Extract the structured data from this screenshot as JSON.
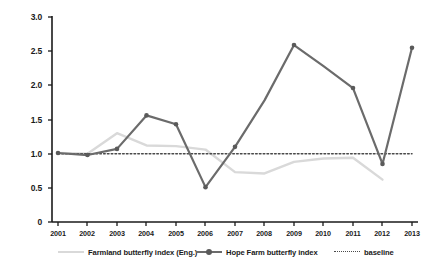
{
  "chart_data": {
    "type": "line",
    "title": "",
    "xlabel": "",
    "ylabel": "",
    "categories": [
      "2001",
      "2002",
      "2003",
      "2004",
      "2005",
      "2006",
      "2007",
      "2008",
      "2009",
      "2010",
      "2011",
      "2012",
      "2013"
    ],
    "x": [
      2001,
      2002,
      2003,
      2004,
      2005,
      2006,
      2007,
      2008,
      2009,
      2010,
      2011,
      2012,
      2013
    ],
    "ylim": [
      0,
      3.0
    ],
    "xlim": [
      2001,
      2013
    ],
    "yticks": [
      "0",
      "0.5",
      "1.0",
      "1.5",
      "2.0",
      "2.5",
      "3.0"
    ],
    "ytick_values": [
      0,
      0.5,
      1.0,
      1.5,
      2.0,
      2.5,
      3.0
    ],
    "grid": false,
    "legend_position": "bottom",
    "series": [
      {
        "name": "Farmland butterfly index (Eng.)",
        "color": "#d9d9d9",
        "style": "solid",
        "markers": false,
        "values": [
          1.01,
          1.0,
          1.3,
          1.12,
          1.11,
          1.06,
          0.73,
          0.71,
          0.88,
          0.93,
          0.94,
          0.62,
          null
        ]
      },
      {
        "name": "Hope Farm butterfly index",
        "color": "#6b6b6b",
        "style": "solid",
        "markers": true,
        "values": [
          1.01,
          0.98,
          1.07,
          1.56,
          1.43,
          0.51,
          1.1,
          1.78,
          2.59,
          2.28,
          1.96,
          0.85,
          2.55
        ]
      },
      {
        "name": "baseline",
        "color": "#4a4a4a",
        "style": "dotted",
        "markers": false,
        "values": [
          1.0,
          1.0,
          1.0,
          1.0,
          1.0,
          1.0,
          1.0,
          1.0,
          1.0,
          1.0,
          1.0,
          1.0,
          1.0
        ]
      }
    ],
    "legend": [
      "Farmland butterfly index (Eng.)",
      "Hope Farm butterfly index",
      "baseline"
    ],
    "colors": {
      "farmland": "#d9d9d9",
      "hope_farm": "#6b6b6b",
      "baseline": "#4a4a4a",
      "axis": "#1a1a1a",
      "background": "#ffffff"
    }
  },
  "legend": {
    "farmland_label": "Farmland butterfly index (Eng.)",
    "hope_farm_label": "Hope Farm butterfly index",
    "baseline_label": "baseline"
  },
  "axes": {
    "y_labels": [
      "3.0",
      "2.5",
      "2.0",
      "1.5",
      "1.0",
      "0.5",
      "0"
    ],
    "x_labels": [
      "2001",
      "2002",
      "2003",
      "2004",
      "2005",
      "2006",
      "2007",
      "2008",
      "2009",
      "2010",
      "2011",
      "2012",
      "2013"
    ]
  }
}
